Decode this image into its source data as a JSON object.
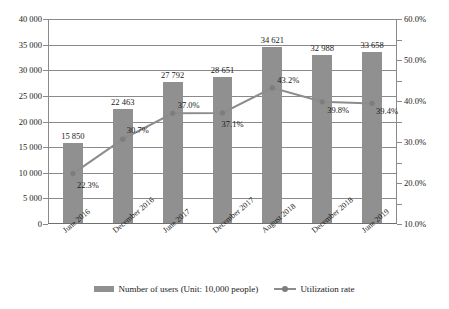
{
  "top_remnant": "",
  "chart_data": {
    "type": "bar",
    "title": "",
    "subtitle": "",
    "xlabel": "",
    "ylabel": "",
    "y2label": "",
    "grid": true,
    "legend_position": "bottom",
    "categories": [
      "June 2016",
      "December 2016",
      "June 2017",
      "December 2017",
      "August 2018",
      "December 2018",
      "June 2019"
    ],
    "series": [
      {
        "name": "Number of users (Unit: 10,000 people)",
        "type": "bar",
        "axis": "left",
        "color": "#909090",
        "values": [
          15850,
          22463,
          27792,
          28651,
          34621,
          32988,
          33658
        ],
        "value_labels": [
          "15 850",
          "22 463",
          "27 792",
          "28 651",
          "34 621",
          "32 988",
          "33 658"
        ]
      },
      {
        "name": "Utilization rate",
        "type": "line",
        "axis": "right",
        "color": "#8c8c8c",
        "values": [
          22.3,
          30.7,
          37.0,
          37.1,
          43.2,
          39.8,
          39.4
        ],
        "value_labels": [
          "22.3%",
          "30.7%",
          "37.0%",
          "37.1%",
          "43.2%",
          "39.8%",
          "39.4%"
        ]
      }
    ],
    "yaxis_left": {
      "min": 0,
      "max": 40000,
      "step": 5000,
      "ticks": [
        0,
        5000,
        10000,
        15000,
        20000,
        25000,
        30000,
        35000,
        40000
      ],
      "tick_labels": [
        "0",
        "5 000",
        "10 000",
        "15 000",
        "20 000",
        "25 000",
        "30 000",
        "35 000",
        "40 000"
      ]
    },
    "yaxis_right": {
      "min": 10.0,
      "max": 60.0,
      "step": 5.0,
      "ticks": [
        10.0,
        15.0,
        20.0,
        25.0,
        30.0,
        35.0,
        40.0,
        45.0,
        50.0,
        55.0,
        60.0
      ],
      "labeled_ticks": [
        10.0,
        20.0,
        30.0,
        40.0,
        50.0,
        60.0
      ],
      "tick_labels": [
        "10.0%",
        "20.0%",
        "30.0%",
        "40.0%",
        "50.0%",
        "60.0%"
      ]
    }
  },
  "legend": {
    "items": [
      {
        "label": "Number of users (Unit: 10,000 people)",
        "marker": "bar-swatch"
      },
      {
        "label": "Utilization rate",
        "marker": "line-marker-swatch"
      }
    ]
  }
}
